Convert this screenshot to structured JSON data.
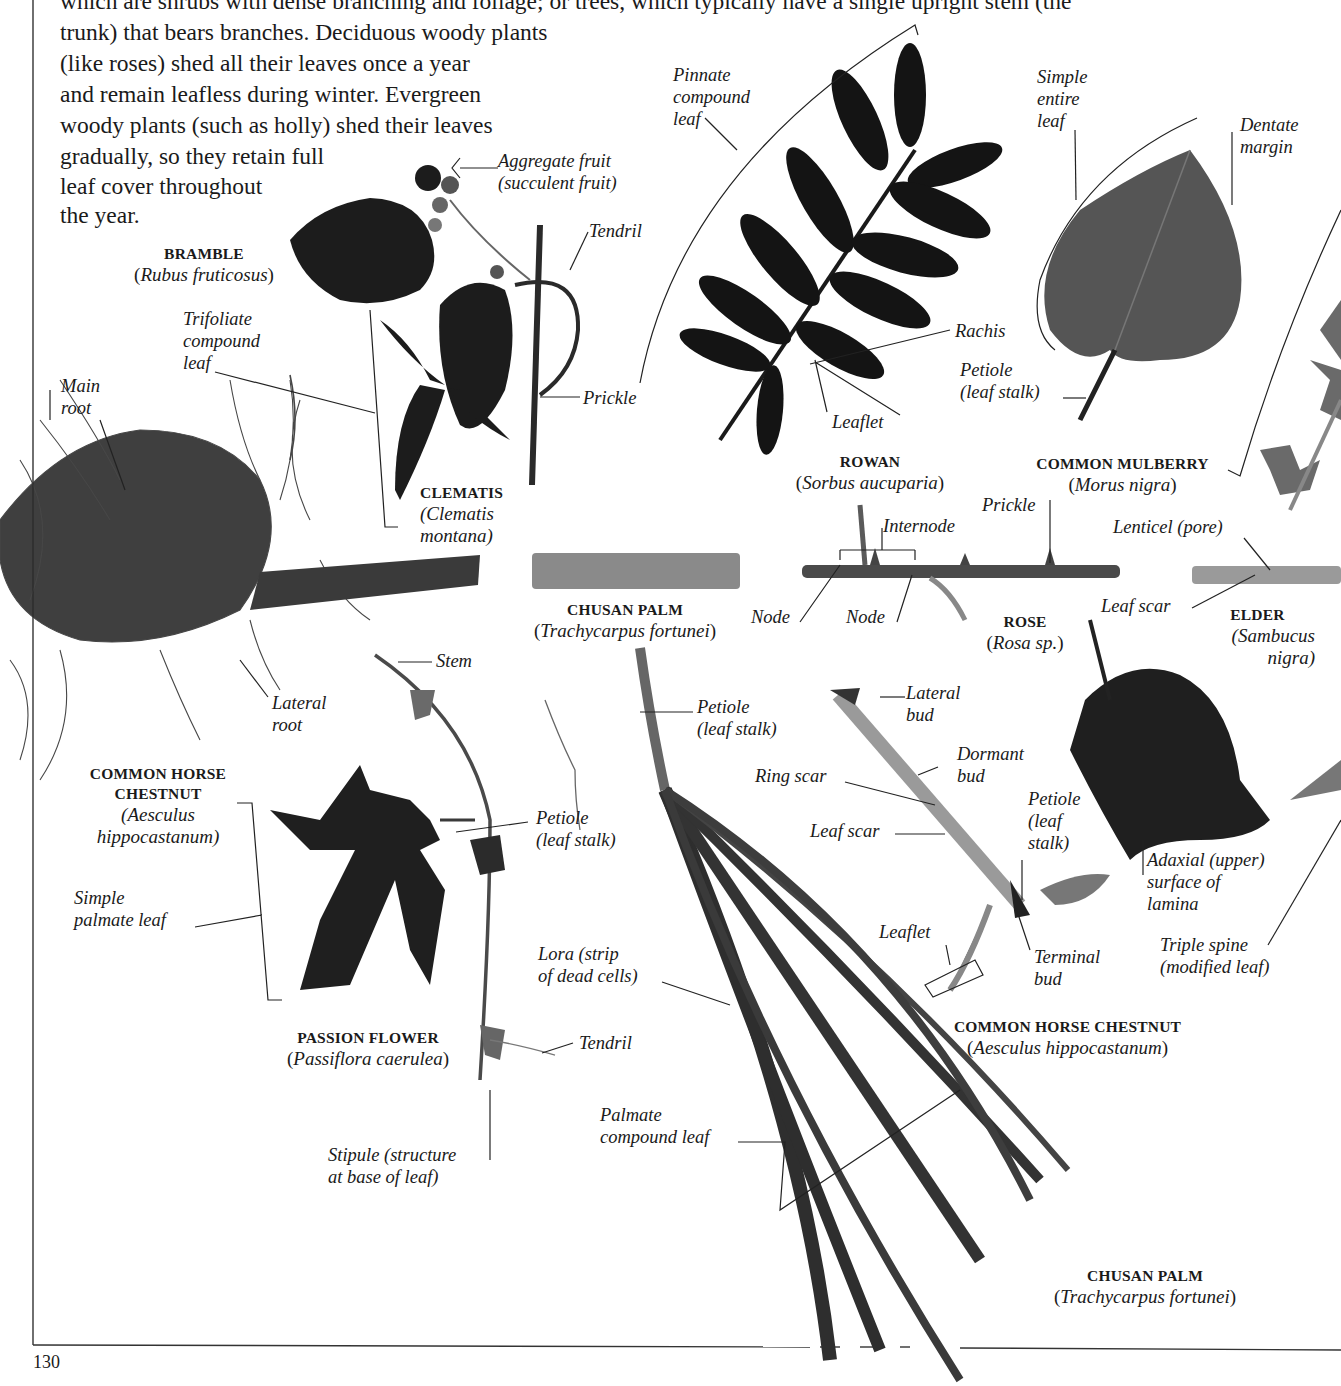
{
  "page": {
    "page_number": "130",
    "intro_text": {
      "lines": [
        "which are shrubs with dense branching and foliage; or trees, which typically have a single upright stem (the",
        "trunk) that bears branches. Deciduous woody plants",
        "(like roses) shed all their leaves once a year",
        "and remain leafless during winter. Evergreen",
        "woody plants (such as holly) shed their leaves",
        "gradually, so they retain full",
        "leaf cover throughout",
        "the year."
      ]
    },
    "specimens": [
      {
        "id": "bramble",
        "common": "BRAMBLE",
        "latin": "Rubus fruticosus"
      },
      {
        "id": "clematis",
        "common": "CLEMATIS",
        "latin_line1": "(Clematis",
        "latin_line2": "montana)"
      },
      {
        "id": "rowan",
        "common": "ROWAN",
        "latin": "Sorbus aucuparia"
      },
      {
        "id": "mulberry",
        "common": "COMMON MULBERRY",
        "latin": "Morus nigra"
      },
      {
        "id": "chusan-palm-stem",
        "common": "CHUSAN PALM",
        "latin": "Trachycarpus fortunei"
      },
      {
        "id": "rose",
        "common": "ROSE",
        "latin": "Rosa sp."
      },
      {
        "id": "elder",
        "common": "ELDER",
        "latin_line1": "(Sambucus",
        "latin_line2": "nigra)"
      },
      {
        "id": "horse-chestnut-root",
        "common_line1": "COMMON HORSE",
        "common_line2": "CHESTNUT",
        "latin_line1": "(Aesculus",
        "latin_line2": "hippocastanum)"
      },
      {
        "id": "passion-flower",
        "common": "PASSION FLOWER",
        "latin": "Passiflora caerulea"
      },
      {
        "id": "horse-chestnut-twig",
        "common": "COMMON HORSE CHESTNUT",
        "latin": "Aesculus hippocastanum"
      },
      {
        "id": "chusan-palm-leaf",
        "common": "CHUSAN PALM",
        "latin": "Trachycarpus fortunei"
      }
    ],
    "labels": {
      "aggregate_fruit": [
        "Aggregate fruit",
        "(succulent fruit)"
      ],
      "tendril_top": [
        "Tendril"
      ],
      "trifoliate": [
        "Trifoliate",
        "compound",
        "leaf"
      ],
      "prickle_bramble": [
        "Prickle"
      ],
      "main_root": [
        "Main",
        "root"
      ],
      "pinnate": [
        "Pinnate",
        "compound",
        "leaf"
      ],
      "rachis": [
        "Rachis"
      ],
      "leaflet_rowan": [
        "Leaflet"
      ],
      "simple_entire": [
        "Simple",
        "entire",
        "leaf"
      ],
      "dentate": [
        "Dentate",
        "margin"
      ],
      "petiole_mulberry": [
        "Petiole",
        "(leaf stalk)"
      ],
      "prickle_rose": [
        "Prickle"
      ],
      "internode": [
        "Internode"
      ],
      "node1": [
        "Node"
      ],
      "node2": [
        "Node"
      ],
      "lenticel": [
        "Lenticel (pore)"
      ],
      "leaf_scar_elder": [
        "Leaf scar"
      ],
      "lateral_root": [
        "Lateral",
        "root"
      ],
      "stem": [
        "Stem"
      ],
      "petiole_passion": [
        "Petiole",
        "(leaf stalk)"
      ],
      "petiole_palm": [
        "Petiole",
        "(leaf stalk)"
      ],
      "simple_palmate": [
        "Simple",
        "palmate leaf"
      ],
      "lateral_bud": [
        "Lateral",
        "bud"
      ],
      "dormant_bud": [
        "Dormant",
        "bud"
      ],
      "ring_scar": [
        "Ring scar"
      ],
      "leaf_scar_twig": [
        "Leaf scar"
      ],
      "petiole_twig": [
        "Petiole",
        "(leaf",
        "stalk)"
      ],
      "leaflet_twig": [
        "Leaflet"
      ],
      "terminal_bud": [
        "Terminal",
        "bud"
      ],
      "adaxial": [
        "Adaxial (upper)",
        "surface of",
        "lamina"
      ],
      "triple_spine": [
        "Triple spine",
        "(modified leaf)"
      ],
      "lora": [
        "Lora (strip",
        "of dead cells)"
      ],
      "tendril_passion": [
        "Tendril"
      ],
      "palmate_compound": [
        "Palmate",
        "compound leaf"
      ],
      "stipule": [
        "Stipule (structure",
        "at base of leaf)"
      ]
    }
  }
}
